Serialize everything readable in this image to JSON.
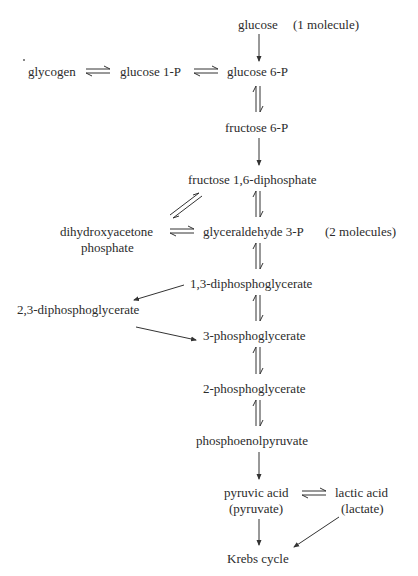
{
  "diagram": {
    "type": "metabolic-pathway",
    "nodes": {
      "glucose": "glucose",
      "glucose_note": "(1 molecule)",
      "glycogen": "glycogen",
      "glucose_1p": "glucose 1-P",
      "glucose_6p": "glucose 6-P",
      "fructose_6p": "fructose 6-P",
      "fructose_16dp": "fructose 1,6-diphosphate",
      "dhap_line1": "dihydroxyacetone",
      "dhap_line2": "phosphate",
      "g3p": "glyceraldehyde 3-P",
      "g3p_note": "(2 molecules)",
      "bpg13": "1,3-diphosphoglycerate",
      "bpg23": "2,3-diphosphoglycerate",
      "pg3": "3-phosphoglycerate",
      "pg2": "2-phosphoglycerate",
      "pep": "phosphoenolpyruvate",
      "pyruvic_line1": "pyruvic acid",
      "pyruvic_line2": "(pyruvate)",
      "lactic_line1": "lactic acid",
      "lactic_line2": "(lactate)",
      "krebs": "Krebs cycle"
    },
    "edges": [
      {
        "from": "glucose",
        "to": "glucose 6-P",
        "type": "irreversible"
      },
      {
        "from": "glycogen",
        "to": "glucose 1-P",
        "type": "reversible"
      },
      {
        "from": "glucose 1-P",
        "to": "glucose 6-P",
        "type": "reversible"
      },
      {
        "from": "glucose 6-P",
        "to": "fructose 6-P",
        "type": "reversible"
      },
      {
        "from": "fructose 6-P",
        "to": "fructose 1,6-diphosphate",
        "type": "irreversible"
      },
      {
        "from": "fructose 1,6-diphosphate",
        "to": "dihydroxyacetone phosphate",
        "type": "reversible"
      },
      {
        "from": "fructose 1,6-diphosphate",
        "to": "glyceraldehyde 3-P",
        "type": "reversible"
      },
      {
        "from": "dihydroxyacetone phosphate",
        "to": "glyceraldehyde 3-P",
        "type": "reversible"
      },
      {
        "from": "glyceraldehyde 3-P",
        "to": "1,3-diphosphoglycerate",
        "type": "reversible"
      },
      {
        "from": "1,3-diphosphoglycerate",
        "to": "2,3-diphosphoglycerate",
        "type": "irreversible"
      },
      {
        "from": "2,3-diphosphoglycerate",
        "to": "3-phosphoglycerate",
        "type": "irreversible"
      },
      {
        "from": "1,3-diphosphoglycerate",
        "to": "3-phosphoglycerate",
        "type": "reversible"
      },
      {
        "from": "3-phosphoglycerate",
        "to": "2-phosphoglycerate",
        "type": "reversible"
      },
      {
        "from": "2-phosphoglycerate",
        "to": "phosphoenolpyruvate",
        "type": "reversible"
      },
      {
        "from": "phosphoenolpyruvate",
        "to": "pyruvic acid",
        "type": "irreversible"
      },
      {
        "from": "pyruvic acid",
        "to": "lactic acid",
        "type": "reversible"
      },
      {
        "from": "pyruvic acid",
        "to": "Krebs cycle",
        "type": "irreversible"
      },
      {
        "from": "lactic acid",
        "to": "Krebs cycle",
        "type": "irreversible"
      }
    ]
  }
}
